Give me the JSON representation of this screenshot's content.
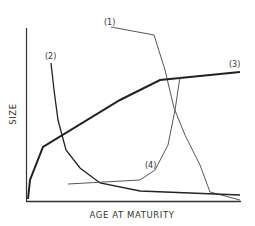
{
  "chart_data": {
    "type": "line",
    "title": "",
    "xlabel": "AGE AT MATURITY",
    "ylabel": "SIZE",
    "grid": false,
    "legend": "inline labels",
    "axis_ticks": "none",
    "series": [
      {
        "name": "(1)",
        "label": "(1)",
        "weight": "thin",
        "points_px": [
          [
            111,
            27
          ],
          [
            154,
            35
          ],
          [
            165,
            70
          ],
          [
            174,
            108
          ],
          [
            185,
            135
          ],
          [
            200,
            165
          ],
          [
            210,
            192
          ],
          [
            240,
            200
          ]
        ]
      },
      {
        "name": "(2)",
        "label": "(2)",
        "weight": "medium",
        "points_px": [
          [
            51,
            63
          ],
          [
            54,
            90
          ],
          [
            58,
            120
          ],
          [
            66,
            150
          ],
          [
            80,
            168
          ],
          [
            100,
            183
          ],
          [
            140,
            191
          ],
          [
            240,
            195
          ]
        ]
      },
      {
        "name": "(3)",
        "label": "(3)",
        "weight": "thick",
        "points_px": [
          [
            28,
            199
          ],
          [
            30,
            180
          ],
          [
            43,
            147
          ],
          [
            120,
            100
          ],
          [
            160,
            80
          ],
          [
            240,
            72
          ]
        ]
      },
      {
        "name": "(4)",
        "label": "(4)",
        "weight": "thin",
        "points_px": [
          [
            68,
            184
          ],
          [
            140,
            180
          ],
          [
            155,
            170
          ],
          [
            168,
            145
          ],
          [
            175,
            110
          ],
          [
            180,
            77
          ]
        ]
      }
    ],
    "series_labels_px": {
      "(1)": [
        104,
        25
      ],
      "(2)": [
        45,
        59
      ],
      "(3)": [
        229,
        67
      ],
      "(4)": [
        145,
        168
      ]
    }
  }
}
